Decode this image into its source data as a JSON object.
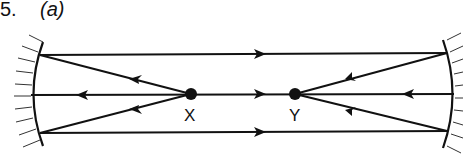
{
  "question_number": "5.",
  "part_label": "(a)",
  "points": [
    {
      "name": "X",
      "x": 191,
      "y": 94
    },
    {
      "name": "Y",
      "x": 295,
      "y": 94
    }
  ],
  "colors": {
    "ink": "#111111",
    "background": "#ffffff"
  }
}
